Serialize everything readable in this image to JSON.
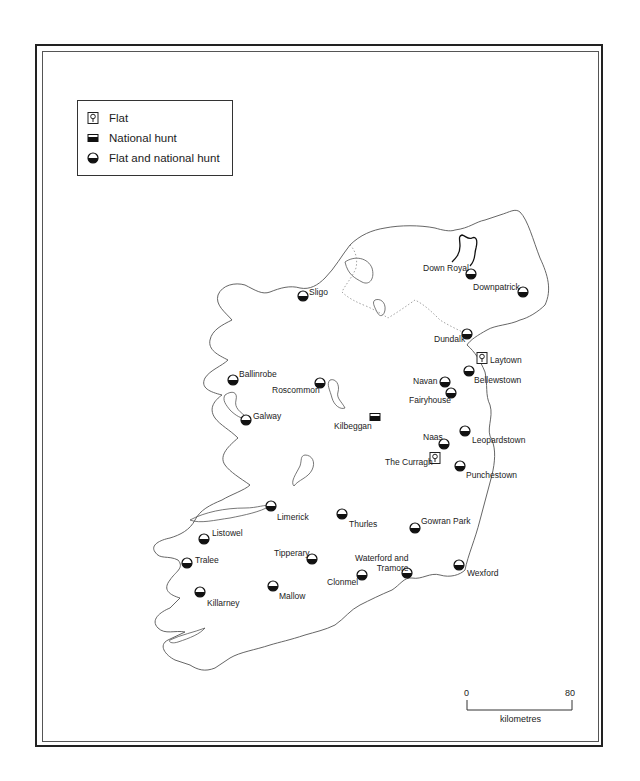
{
  "legend": {
    "items": [
      {
        "symbol": "flat-icon",
        "label": "Flat"
      },
      {
        "symbol": "national-hunt-icon",
        "label": "National hunt"
      },
      {
        "symbol": "flat-and-national-hunt-icon",
        "label": "Flat and national hunt"
      }
    ]
  },
  "racecourses": [
    {
      "name": "Down Royal",
      "type": "flat-and-national-hunt",
      "x": 471,
      "y": 274,
      "lx": 423,
      "ly": 263
    },
    {
      "name": "Downpatrick",
      "type": "flat-and-national-hunt",
      "x": 523,
      "y": 292,
      "lx": 473,
      "ly": 282
    },
    {
      "name": "Sligo",
      "type": "flat-and-national-hunt",
      "x": 303,
      "y": 296,
      "lx": 309,
      "ly": 287
    },
    {
      "name": "Dundalk",
      "type": "flat-and-national-hunt",
      "x": 467,
      "y": 334,
      "lx": 434,
      "ly": 334
    },
    {
      "name": "Laytown",
      "type": "flat",
      "x": 482,
      "y": 358,
      "lx": 490,
      "ly": 355
    },
    {
      "name": "Ballinrobe",
      "type": "flat-and-national-hunt",
      "x": 233,
      "y": 380,
      "lx": 239,
      "ly": 369
    },
    {
      "name": "Roscommon",
      "type": "flat-and-national-hunt",
      "x": 320,
      "y": 383,
      "lx": 272,
      "ly": 385
    },
    {
      "name": "Bellewstown",
      "type": "flat-and-national-hunt",
      "x": 469,
      "y": 371,
      "lx": 474,
      "ly": 375
    },
    {
      "name": "Navan",
      "type": "flat-and-national-hunt",
      "x": 445,
      "y": 382,
      "lx": 413,
      "ly": 376
    },
    {
      "name": "Fairyhouse",
      "type": "flat-and-national-hunt",
      "x": 451,
      "y": 393,
      "lx": 409,
      "ly": 395
    },
    {
      "name": "Galway",
      "type": "flat-and-national-hunt",
      "x": 246,
      "y": 420,
      "lx": 253,
      "ly": 411
    },
    {
      "name": "Kilbeggan",
      "type": "national-hunt",
      "x": 375,
      "y": 417,
      "lx": 334,
      "ly": 421
    },
    {
      "name": "Leopardstown",
      "type": "flat-and-national-hunt",
      "x": 465,
      "y": 431,
      "lx": 472,
      "ly": 435
    },
    {
      "name": "Naas",
      "type": "flat-and-national-hunt",
      "x": 444,
      "y": 444,
      "lx": 423,
      "ly": 432
    },
    {
      "name": "The Curragh",
      "type": "flat",
      "x": 435,
      "y": 458,
      "lx": 385,
      "ly": 457
    },
    {
      "name": "Punchestown",
      "type": "flat-and-national-hunt",
      "x": 460,
      "y": 466,
      "lx": 466,
      "ly": 470
    },
    {
      "name": "Limerick",
      "type": "flat-and-national-hunt",
      "x": 271,
      "y": 506,
      "lx": 277,
      "ly": 512
    },
    {
      "name": "Thurles",
      "type": "flat-and-national-hunt",
      "x": 342,
      "y": 514,
      "lx": 349,
      "ly": 519
    },
    {
      "name": "Gowran Park",
      "type": "flat-and-national-hunt",
      "x": 415,
      "y": 528,
      "lx": 421,
      "ly": 516
    },
    {
      "name": "Listowel",
      "type": "flat-and-national-hunt",
      "x": 204,
      "y": 539,
      "lx": 212,
      "ly": 528
    },
    {
      "name": "Tipperary",
      "type": "flat-and-national-hunt",
      "x": 312,
      "y": 559,
      "lx": 274,
      "ly": 548
    },
    {
      "name": "Tralee",
      "type": "flat-and-national-hunt",
      "x": 187,
      "y": 563,
      "lx": 195,
      "ly": 555
    },
    {
      "name": "Waterford and\nTramore",
      "type": "flat-and-national-hunt",
      "x": 407,
      "y": 573,
      "lx": 355,
      "ly": 553
    },
    {
      "name": "Wexford",
      "type": "flat-and-national-hunt",
      "x": 459,
      "y": 565,
      "lx": 467,
      "ly": 568
    },
    {
      "name": "Clonmel",
      "type": "flat-and-national-hunt",
      "x": 362,
      "y": 575,
      "lx": 327,
      "ly": 577
    },
    {
      "name": "Mallow",
      "type": "flat-and-national-hunt",
      "x": 273,
      "y": 586,
      "lx": 279,
      "ly": 591
    },
    {
      "name": "Killarney",
      "type": "flat-and-national-hunt",
      "x": 200,
      "y": 592,
      "lx": 207,
      "ly": 598
    }
  ],
  "scale": {
    "start_label": "0",
    "end_label": "80",
    "unit_label": "kilometres"
  },
  "colors": {
    "ink": "#222222",
    "coast": "#555555",
    "border": "#999999"
  }
}
